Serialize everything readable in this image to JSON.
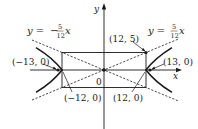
{
  "diagram": {
    "type": "hyperbola-with-asymptotes",
    "axes": {
      "x_label": "x",
      "y_label": "y",
      "origin_label": "0"
    },
    "asymptotes": [
      {
        "name": "positive-slope",
        "eq_prefix": "y = ",
        "sign": "",
        "numerator": "5",
        "denominator": "12",
        "var": "x"
      },
      {
        "name": "negative-slope",
        "eq_prefix": "y = ",
        "sign": "−",
        "numerator": "5",
        "denominator": "12",
        "var": "x"
      }
    ],
    "points": {
      "corner": "(12, 5)",
      "right_focus": "(13, 0)",
      "left_focus": "(−13, 0)",
      "right_vertex": "(12, 0)",
      "left_vertex": "(−12, 0)"
    },
    "parameters": {
      "a": 12,
      "b": 5,
      "c": 13
    },
    "colors": {
      "ink": "#1a1a1a",
      "background": "#ffffff"
    }
  }
}
